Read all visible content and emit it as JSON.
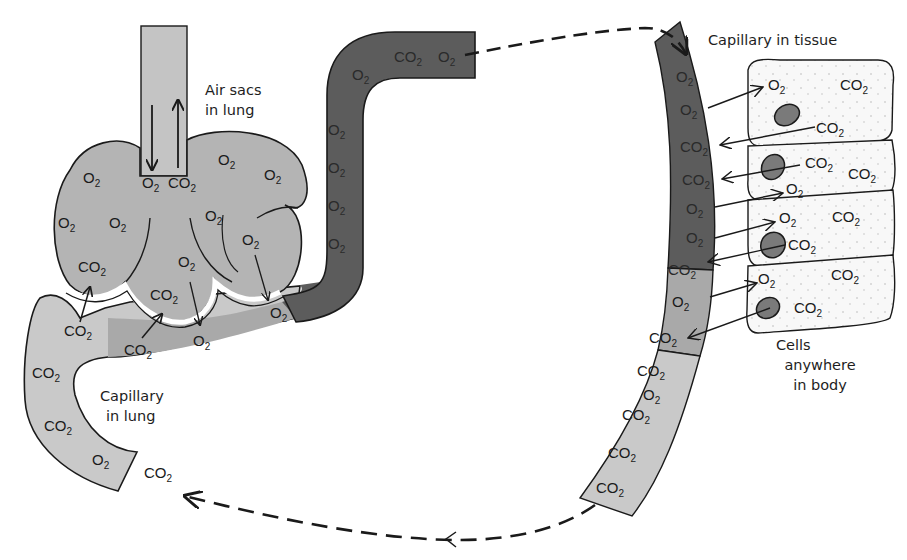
{
  "diagram": {
    "labels": {
      "air_sacs": [
        "Air sacs",
        "in lung"
      ],
      "capillary_lung": [
        "Capillary",
        "in lung"
      ],
      "capillary_tissue": "Capillary in tissue",
      "cells": [
        "Cells",
        "anywhere",
        "in body"
      ]
    },
    "molecules": {
      "o2": "O",
      "co2": "CO",
      "subscript": "2"
    },
    "colors": {
      "light_blood": "#c9c9c9",
      "mid_blood": "#a9a9a9",
      "air_sac": "#b4b4b4",
      "dark_blood": "#5c5c5c",
      "cell_fill": "#f7f7f7",
      "nucleus": "#7a7a7a",
      "outline": "#1a1a1a"
    },
    "airway": {
      "in_arrow": "O2",
      "out_arrow": "CO2"
    },
    "air_sac_contents": [
      "O2",
      "O2",
      "O2",
      "O2",
      "O2",
      "O2",
      "O2",
      "O2",
      "CO2",
      "CO2",
      "O2"
    ],
    "lung_capillary_contents": [
      "CO2",
      "CO2",
      "CO2",
      "CO2",
      "O2",
      "CO2",
      "O2",
      "O2"
    ],
    "oxygenated_vessel_contents": [
      "CO2",
      "O2",
      "O2",
      "O2",
      "O2",
      "O2",
      "O2"
    ],
    "tissue_capillary_contents": [
      "O2",
      "O2",
      "CO2",
      "CO2",
      "O2",
      "O2",
      "CO2",
      "O2",
      "CO2",
      "CO2",
      "O2",
      "CO2",
      "CO2",
      "CO2"
    ],
    "tissue_cells": [
      {
        "molecules": [
          "O2",
          "CO2",
          "CO2"
        ]
      },
      {
        "molecules": [
          "CO2",
          "CO2",
          "O2"
        ]
      },
      {
        "molecules": [
          "O2",
          "CO2",
          "CO2"
        ]
      },
      {
        "molecules": [
          "O2",
          "CO2",
          "CO2"
        ]
      }
    ],
    "flow": {
      "top_arrow": "oxygenated blood to tissue",
      "bottom_arrow": "deoxygenated blood returning to lung",
      "exhaled_label": "CO2"
    }
  }
}
